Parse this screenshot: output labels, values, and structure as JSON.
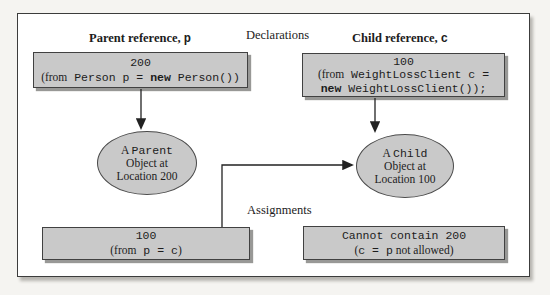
{
  "colors": {
    "page_bg": "#f5f4f1",
    "frame_bg": "#ffffff",
    "frame_border": "#3c3c3c",
    "box_fill": "#c9c9c9",
    "box_border": "#414141",
    "arrow": "#222222"
  },
  "labels": {
    "declarations": "Declarations",
    "assignments": "Assignments"
  },
  "parent": {
    "header": {
      "text": "Parent reference, ",
      "var": "p"
    },
    "decl_box": {
      "value": "200",
      "from": "(from",
      "code": " Person p = ",
      "keyword": "new",
      "rest": " Person())"
    },
    "object": {
      "a": "A ",
      "class": "Parent",
      "line2": "Object at",
      "line3": "Location 200"
    },
    "assign_box": {
      "value": "100",
      "from": "(from",
      "code": " p = c",
      "close": ")"
    }
  },
  "child": {
    "header": {
      "text": "Child reference, ",
      "var": "c"
    },
    "decl_box": {
      "value": "100",
      "from": "(from",
      "code": " WeightLossClient c =",
      "keyword": "new",
      "rest": " WeightLossClient());"
    },
    "object": {
      "a": "A ",
      "class": "Child",
      "line2": "Object at",
      "line3": "Location 100"
    },
    "assign_box": {
      "line1": "Cannot contain 200",
      "open": "(",
      "code": "c = p",
      "rest": " not allowed)"
    }
  }
}
